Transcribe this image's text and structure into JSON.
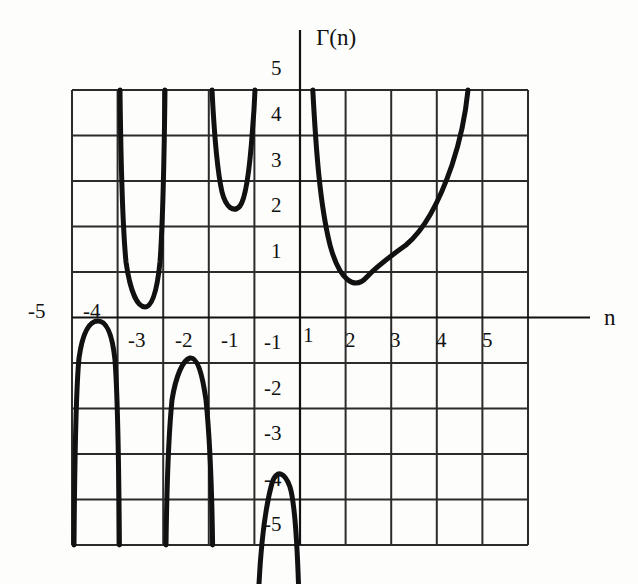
{
  "figure": {
    "y_axis_title": "Γ(n)",
    "x_axis_title": "n"
  },
  "x_tick_labels": [
    {
      "text": "-5",
      "x": 28,
      "y": 301
    },
    {
      "text": "-4",
      "x": 83,
      "y": 301
    },
    {
      "text": "-3",
      "x": 128,
      "y": 330
    },
    {
      "text": "-2",
      "x": 175,
      "y": 330
    },
    {
      "text": "-1",
      "x": 221,
      "y": 330
    },
    {
      "text": "1",
      "x": 303,
      "y": 325
    },
    {
      "text": "2",
      "x": 345,
      "y": 330
    },
    {
      "text": "3",
      "x": 390,
      "y": 330
    },
    {
      "text": "4",
      "x": 436,
      "y": 330
    },
    {
      "text": "5",
      "x": 482,
      "y": 330
    }
  ],
  "y_tick_labels": [
    {
      "text": "5",
      "x": 271,
      "y": 58
    },
    {
      "text": "4",
      "x": 271,
      "y": 104
    },
    {
      "text": "3",
      "x": 271,
      "y": 150
    },
    {
      "text": "2",
      "x": 271,
      "y": 195
    },
    {
      "text": "1",
      "x": 271,
      "y": 241
    },
    {
      "text": "-1",
      "x": 264,
      "y": 332
    },
    {
      "text": "-2",
      "x": 264,
      "y": 378
    },
    {
      "text": "-3",
      "x": 264,
      "y": 423
    },
    {
      "text": "-4",
      "x": 264,
      "y": 469
    },
    {
      "text": "-5",
      "x": 264,
      "y": 514
    }
  ],
  "colors": {
    "curve": "#111111",
    "grid": "#2b2b2b",
    "axis": "#111111",
    "background": "#fdfdfb",
    "text": "#111111"
  },
  "chart_data": {
    "type": "line",
    "title": "",
    "subtitle": "",
    "xlabel": "n",
    "ylabel": "Γ(n)",
    "xlim": [
      -5,
      5
    ],
    "ylim": [
      -5,
      5
    ],
    "xticks": [
      -5,
      -4,
      -3,
      -2,
      -1,
      1,
      2,
      3,
      4,
      5
    ],
    "yticks": [
      5,
      4,
      3,
      2,
      1,
      -1,
      -2,
      -3,
      -4,
      -5
    ],
    "grid": true,
    "legend": null,
    "annotations": [],
    "function": "Gamma function Γ(n), with poles at n = 0, -1, -2, -3, -4, -5",
    "asymptotes": [
      0,
      -1,
      -2,
      -3,
      -4,
      -5
    ],
    "series": [
      {
        "name": "Γ(n), n > 0",
        "x": [
          0.28,
          0.35,
          0.45,
          0.6,
          0.8,
          1.0,
          1.2,
          1.4616,
          1.8,
          2.2,
          2.6,
          3.0,
          3.3,
          3.55,
          3.68
        ],
        "y": [
          3.27,
          2.55,
          1.93,
          1.49,
          1.16,
          1.0,
          0.918,
          0.8856,
          0.9314,
          1.1018,
          1.4296,
          2.0,
          2.6834,
          3.6,
          5.0
        ],
        "minimum": {
          "x": 1.4616,
          "y": 0.8856
        }
      },
      {
        "name": "Γ(n), -1 < n < 0",
        "x": [
          -0.95,
          -0.9,
          -0.8,
          -0.7,
          -0.6,
          -0.5045,
          -0.4,
          -0.3,
          -0.22,
          -0.2
        ],
        "y": [
          -20.5,
          -10.57,
          -5.74,
          -4.27,
          -3.7,
          -3.5444,
          -3.72,
          -4.33,
          -5.5,
          -6.1
        ],
        "maximum": {
          "x": -0.5045,
          "y": -3.5444
        }
      },
      {
        "name": "Γ(n), -2 < n < -1",
        "x": [
          -1.93,
          -1.9,
          -1.8,
          -1.7,
          -1.5729,
          -1.45,
          -1.3,
          -1.15,
          -1.08
        ],
        "y": [
          5.0,
          4.1,
          2.87,
          2.47,
          2.3024,
          2.42,
          2.99,
          4.5,
          6.3
        ],
        "minimum": {
          "x": -1.5729,
          "y": 2.3024
        }
      },
      {
        "name": "Γ(n), -3 < n < -2",
        "x": [
          -2.95,
          -2.9,
          -2.8,
          -2.7,
          -2.6107,
          -2.5,
          -2.35,
          -2.2,
          -2.1
        ],
        "y": [
          -5.3,
          -3.0,
          -1.63,
          -1.14,
          -0.8856,
          -0.9453,
          -1.18,
          -1.9,
          -3.5
        ],
        "maximum": {
          "x": -2.6107,
          "y": -0.8856
        }
      },
      {
        "name": "Γ(n), -4 < n < -3",
        "x": [
          -3.96,
          -3.9,
          -3.8,
          -3.7,
          -3.6353,
          -3.5,
          -3.35,
          -3.2,
          -3.08
        ],
        "y": [
          5.1,
          2.4,
          0.88,
          0.42,
          0.2455,
          0.2702,
          0.41,
          0.75,
          2.2
        ],
        "minimum": {
          "x": -3.6353,
          "y": 0.2455
        }
      },
      {
        "name": "Γ(n), -5 < n < -4",
        "x": [
          -4.96,
          -4.92,
          -4.85,
          -4.75,
          -4.6533,
          -4.55,
          -4.4,
          -4.25,
          -4.12
        ],
        "y": [
          -4.6,
          -2.6,
          -1.0,
          -0.3,
          -0.0882,
          -0.085,
          -0.14,
          -0.3,
          -0.9
        ],
        "maximum": {
          "x": -4.6533,
          "y": -0.0882
        }
      }
    ]
  }
}
